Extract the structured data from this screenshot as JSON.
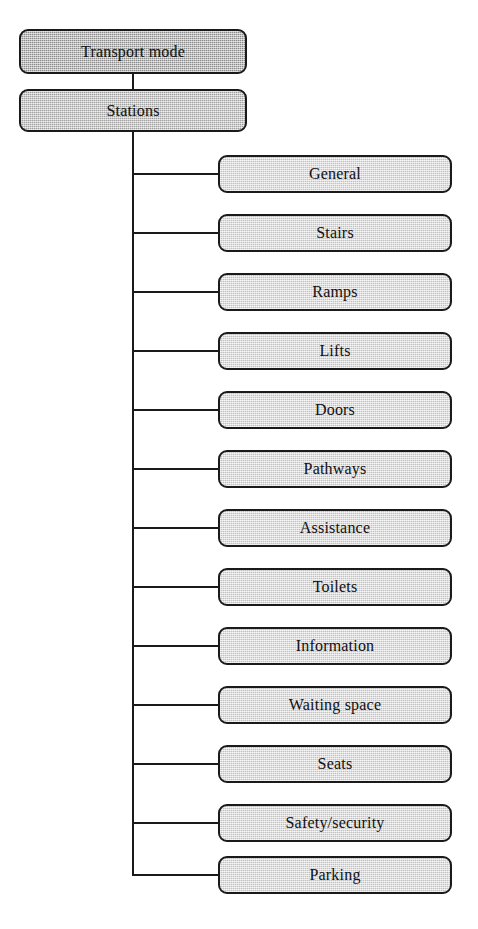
{
  "diagram": {
    "type": "hierarchy-tree",
    "orientation": "vertical-trunk-with-right-children",
    "colors": {
      "root_fill": "#9b9b9b",
      "level2_fill": "#b3b3b3",
      "leaf_fill": "#d7d7d7",
      "stroke": "#1a1a1a",
      "text": "#111111",
      "background": "#ffffff"
    },
    "root": {
      "label": "Transport mode"
    },
    "level2": {
      "label": "Stations"
    },
    "children": [
      {
        "label": "General"
      },
      {
        "label": "Stairs"
      },
      {
        "label": "Ramps"
      },
      {
        "label": "Lifts"
      },
      {
        "label": "Doors"
      },
      {
        "label": "Pathways"
      },
      {
        "label": "Assistance"
      },
      {
        "label": "Toilets"
      },
      {
        "label": "Information"
      },
      {
        "label": "Waiting space"
      },
      {
        "label": "Seats"
      },
      {
        "label": "Safety/security"
      },
      {
        "label": "Parking"
      }
    ]
  }
}
